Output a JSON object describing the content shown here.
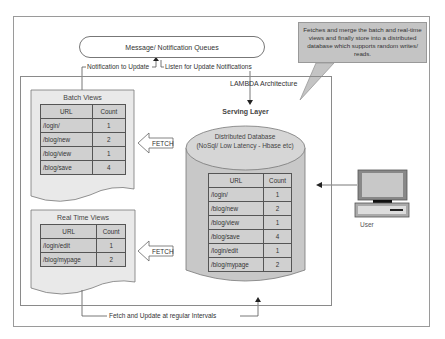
{
  "diagram": {
    "queue_label": "Message/ Notification Queues",
    "notification_to_update": "Notification to Update",
    "listen_for_updates": "Listen for Update Notifications",
    "lambda_title": "LAMBDA Architecture",
    "callout_text": "Fetches and merge the batch and real-time views and finally store into a distributed database which supports random writes/ reads.",
    "fetch_update_label": "Fetch and Update at regular Intervals",
    "user_label": "User",
    "batch_views": {
      "title": "Batch Views",
      "headers": [
        "URL",
        "Count"
      ],
      "rows": [
        {
          "url": "/login/",
          "count": "1"
        },
        {
          "url": "/blog/new",
          "count": "2"
        },
        {
          "url": "/blog/view",
          "count": "1"
        },
        {
          "url": "/blog/save",
          "count": "4"
        }
      ],
      "fetch_label": "FETCH"
    },
    "real_time_views": {
      "title": "Real Time Views",
      "headers": [
        "URL",
        "Count"
      ],
      "rows": [
        {
          "url": "/login/edit",
          "count": "1"
        },
        {
          "url": "/blog/mypage",
          "count": "2"
        }
      ],
      "fetch_label": "FETCH"
    },
    "serving_layer": {
      "title": "Serving Layer",
      "db_title": "Distributed Database",
      "db_subtitle": "(NoSql/ Low Latency - Hbase etc)",
      "headers": [
        "URL",
        "Count"
      ],
      "rows": [
        {
          "url": "/login/",
          "count": "1"
        },
        {
          "url": "/blog/new",
          "count": "2"
        },
        {
          "url": "/blog/view",
          "count": "1"
        },
        {
          "url": "/blog/save",
          "count": "4"
        },
        {
          "url": "/login/edit",
          "count": "1"
        },
        {
          "url": "/blog/mypage",
          "count": "2"
        }
      ]
    },
    "colors": {
      "cylinder_fill": "#c8c8c8",
      "table_fill": "#d0d0d0",
      "callout_fill": "#c4c4c4",
      "line": "#555555"
    }
  }
}
